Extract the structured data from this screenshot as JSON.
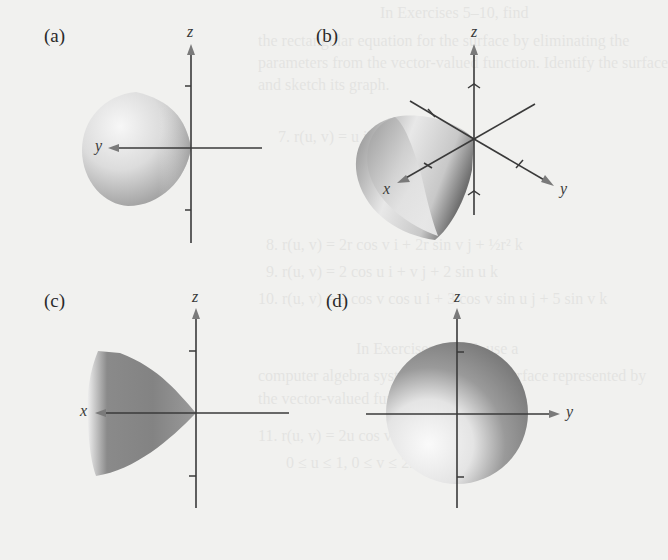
{
  "background_text": {
    "lines": [
      {
        "text": "In Exercises 5–10, find",
        "x": 380,
        "y": 16
      },
      {
        "text": "the rectangular equation for the surface by eliminating the",
        "x": 258,
        "y": 44
      },
      {
        "text": "parameters from the vector-valued function. Identify the surface",
        "x": 258,
        "y": 66
      },
      {
        "text": "and sketch its graph.",
        "x": 258,
        "y": 88
      },
      {
        "text": "7. r(u, v) = u i + v j + ½v k",
        "x": 278,
        "y": 140
      },
      {
        "text": "8. r(u, v) = 2r cos v i + 2r sin v j + ½r² k",
        "x": 266,
        "y": 248
      },
      {
        "text": "9. r(u, v) = 2 cos u i + v j + 2 sin u k",
        "x": 266,
        "y": 275
      },
      {
        "text": "10. r(u, v) = 3 cos v cos u i + 3 cos v sin u j + 5 sin v k",
        "x": 258,
        "y": 302
      },
      {
        "text": "In Exercises 11–16, use a",
        "x": 356,
        "y": 352
      },
      {
        "text": "computer algebra system to graph the surface represented by",
        "x": 258,
        "y": 379
      },
      {
        "text": "the vector-valued function.",
        "x": 258,
        "y": 402
      },
      {
        "text": "11. r(u, v) = 2u cos v i + 2u sin v j + u⁴ k",
        "x": 258,
        "y": 439
      },
      {
        "text": "0 ≤ u ≤ 1,  0 ≤ v ≤ 2π",
        "x": 286,
        "y": 466
      }
    ]
  },
  "figures": [
    {
      "id": "a",
      "label": "(a)",
      "vertical_axis": "z",
      "horizontal_axis": "y",
      "surface": "paraboloid-opening-left"
    },
    {
      "id": "b",
      "label": "(b)",
      "vertical_axis": "z",
      "horizontal_axis_1": "x",
      "horizontal_axis_2": "y",
      "surface": "paraboloid-isometric"
    },
    {
      "id": "c",
      "label": "(c)",
      "vertical_axis": "z",
      "horizontal_axis": "x",
      "surface": "paraboloid-opening-left-dark"
    },
    {
      "id": "d",
      "label": "(d)",
      "vertical_axis": "z",
      "horizontal_axis": "y",
      "surface": "paraboloid-end-on-disk"
    }
  ],
  "colors": {
    "page": "#f1f1ef",
    "axis": "#3a3a3a",
    "arrow": "#7a7a7a",
    "surface_light": "#f4f4f4",
    "surface_dark": "#7d7d7d"
  }
}
